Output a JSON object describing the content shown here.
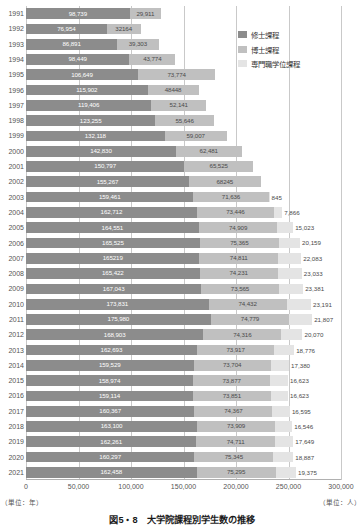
{
  "caption": "図5・8　大学院課程別学生数の推移",
  "axis": {
    "unit_left": "（単位：年）",
    "unit_right": "（単位：人）",
    "xticks": [
      "0",
      "50,000",
      "100,000",
      "150,000",
      "200,000",
      "250,000",
      "300,000"
    ]
  },
  "legend": {
    "items": [
      {
        "label": "修士課程",
        "color": "#8c8c8c"
      },
      {
        "label": "博士課程",
        "color": "#c0c0c0"
      },
      {
        "label": "専門職学位課程",
        "color": "#e4e4e4"
      }
    ]
  },
  "chart_data": {
    "type": "bar",
    "orientation": "horizontal",
    "stacked": true,
    "title": "図5・8　大学院課程別学生数の推移",
    "xlabel": "（単位：人）",
    "ylabel": "（単位：年）",
    "xlim": [
      0,
      300000
    ],
    "xticks": [
      0,
      50000,
      100000,
      150000,
      200000,
      250000,
      300000
    ],
    "grid": true,
    "legend_position": "top-right",
    "categories": [
      "1991",
      "1992",
      "1993",
      "1994",
      "1995",
      "1996",
      "1997",
      "1998",
      "1999",
      "2000",
      "2001",
      "2002",
      "2003",
      "2004",
      "2005",
      "2006",
      "2007",
      "2008",
      "2009",
      "2010",
      "2011",
      "2012",
      "2013",
      "2014",
      "2015",
      "2016",
      "2017",
      "2018",
      "2019",
      "2020",
      "2021"
    ],
    "series": [
      {
        "name": "修士課程",
        "color": "#8c8c8c",
        "values": [
          98739,
          76954,
          86891,
          98449,
          106649,
          115902,
          119406,
          123255,
          132118,
          142830,
          150797,
          155267,
          159461,
          162712,
          164551,
          165525,
          165219,
          165422,
          167043,
          173831,
          175980,
          168903,
          162693,
          159529,
          158974,
          159114,
          160367,
          163100,
          162261,
          160297,
          162458
        ],
        "labels": [
          "98,739",
          "76,954",
          "86,891",
          "98,449",
          "106,649",
          "115,902",
          "119,406",
          "123,255",
          "132,118",
          "142,830",
          "150,797",
          "155,267",
          "159,461",
          "162,712",
          "164,551",
          "165,525",
          "165219",
          "165,422",
          "167,043",
          "173,831",
          "175,980",
          "168,903",
          "162,693",
          "159,529",
          "158,974",
          "159,114",
          "160,367",
          "163,100",
          "162,261",
          "160,297",
          "162,458"
        ]
      },
      {
        "name": "博士課程",
        "color": "#c0c0c0",
        "values": [
          29911,
          32164,
          39303,
          43774,
          73774,
          48448,
          52141,
          55646,
          59007,
          62481,
          65525,
          68245,
          71636,
          73446,
          74909,
          75365,
          74811,
          74231,
          73565,
          74432,
          74779,
          74316,
          73917,
          73704,
          73877,
          73851,
          74367,
          73909,
          74711,
          75345,
          75295
        ],
        "labels": [
          "29,911",
          "32164",
          "39,303",
          "43,774",
          "73,774",
          "48448",
          "52,141",
          "55,646",
          "59,007",
          "62,481",
          "65,525",
          "68245",
          "71,636",
          "73,446",
          "74,909",
          "75,365",
          "74,811",
          "74,231",
          "73,565",
          "74,432",
          "74,779",
          "74,316",
          "73,917",
          "73,704",
          "73,877",
          "73,851",
          "74,367",
          "73,909",
          "74,711",
          "75,345",
          "75,295"
        ]
      },
      {
        "name": "専門職学位課程",
        "color": "#e4e4e4",
        "values": [
          0,
          0,
          0,
          0,
          0,
          0,
          0,
          0,
          0,
          0,
          0,
          0,
          845,
          7866,
          15023,
          20159,
          22083,
          23033,
          23381,
          23191,
          21807,
          20070,
          18776,
          17380,
          16623,
          16623,
          16595,
          16546,
          17649,
          18887,
          19375
        ],
        "labels": [
          "",
          "",
          "",
          "",
          "",
          "",
          "",
          "",
          "",
          "",
          "",
          "",
          "845",
          "7,866",
          "15,023",
          "20,159",
          "22,083",
          "23,033",
          "23,381",
          "23,191",
          "21,807",
          "20,070",
          "18,776",
          "17,380",
          "16,623",
          "16,623",
          "16,595",
          "16,546",
          "17,649",
          "18,887",
          "19,375"
        ]
      }
    ]
  }
}
